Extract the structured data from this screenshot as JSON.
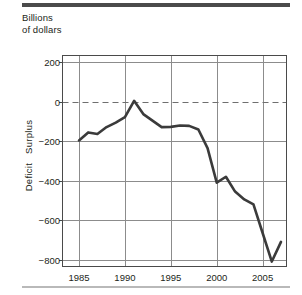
{
  "figure": {
    "title_line1": "Billions",
    "title_line2": "of dollars",
    "title": "Billions\nof dollars",
    "y_axis_label": "Deficit   Surplus",
    "line_color": "#3b3b3b",
    "grid_color": "#8c8c8c",
    "axis_color": "#4a4a4a",
    "zero_line_color": "#6f6f6f",
    "top_rule_color": "#4b4b4b",
    "bottom_rule_color": "#b9b9b9"
  },
  "axes": {
    "y_ticks": [
      200,
      0,
      -200,
      -400,
      -600,
      -800
    ],
    "y_tick_labels": [
      "200",
      "0",
      "−200",
      "−400",
      "−600",
      "−800"
    ],
    "x_ticks": [
      1985,
      1990,
      1995,
      2000,
      2005
    ],
    "x_tick_labels": [
      "1985",
      "1990",
      "1995",
      "2000",
      "2005"
    ]
  },
  "chart_data": {
    "type": "line",
    "title": "Billions of dollars",
    "xlabel": "",
    "ylabel": "Deficit   Surplus",
    "xlim": [
      1983.2,
      2007.6
    ],
    "ylim": [
      -835,
      235
    ],
    "grid": true,
    "legend": "none",
    "annotations": [
      {
        "text": "dashed reference line at zero",
        "y": 0,
        "style": "dashed"
      }
    ],
    "x": [
      1985,
      1986,
      1987,
      1988,
      1989,
      1990,
      1991,
      1992,
      1993,
      1994,
      1995,
      1996,
      1997,
      1998,
      1999,
      2000,
      2001,
      2002,
      2003,
      2004,
      2005,
      2006,
      2007
    ],
    "series": [
      {
        "name": "Federal budget surplus/deficit",
        "values": [
          -196,
          -155,
          -163,
          -128,
          -105,
          -78,
          5,
          -62,
          -95,
          -128,
          -127,
          -120,
          -122,
          -140,
          -235,
          -410,
          -380,
          -455,
          -495,
          -520,
          -665,
          -810,
          -710
        ]
      }
    ]
  }
}
